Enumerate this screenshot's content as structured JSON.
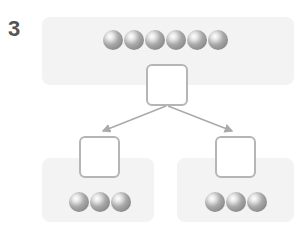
{
  "problem": {
    "number": "3"
  },
  "diagram": {
    "top": {
      "ball_count": 6,
      "answer_box": ""
    },
    "left": {
      "ball_count": 3,
      "answer_box": ""
    },
    "right": {
      "ball_count": 3,
      "answer_box": ""
    }
  },
  "colors": {
    "panel": "#f3f3f3",
    "box_border": "#b5b5b5",
    "arrow": "#aaaaaa",
    "ball": "#9a9a9a"
  }
}
